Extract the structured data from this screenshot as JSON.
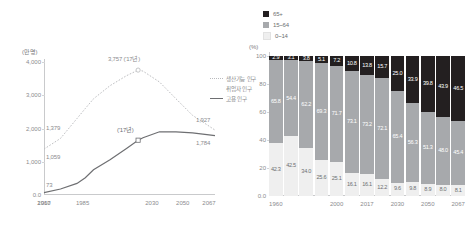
{
  "chart_data": [
    {
      "type": "line",
      "name": "population-projection-line-chart",
      "title": "",
      "ylabel": "(만명)",
      "xlabel": "",
      "ylim": [
        0,
        4000
      ],
      "yticks": [
        "0.0",
        "1,000",
        "2,000",
        "3,000",
        "4,000"
      ],
      "ytick_values": [
        0,
        1000,
        2000,
        3000,
        4000
      ],
      "xticks": [
        "1960",
        "1985",
        "2017",
        "2030",
        "2050",
        "2067"
      ],
      "grid": false,
      "legend_position": "right",
      "series": [
        {
          "name": "생산가능 인구",
          "style": "dotted",
          "color": "#b9babd",
          "x": [
            1960,
            1970,
            1980,
            1985,
            1990,
            2000,
            2010,
            2017,
            2020,
            2030,
            2040,
            2050,
            2060,
            2067
          ],
          "values": [
            1379,
            1700,
            2300,
            2600,
            2900,
            3300,
            3600,
            3757,
            3730,
            3400,
            2900,
            2400,
            2050,
            1927
          ]
        },
        {
          "name": "고용 인구",
          "style": "solid",
          "color": "#6e6f72",
          "x": [
            1960,
            1970,
            1980,
            1985,
            1990,
            2000,
            2010,
            2017,
            2020,
            2030,
            2040,
            2050,
            2060,
            2067
          ],
          "values": [
            73,
            180,
            350,
            520,
            760,
            1059,
            1400,
            1650,
            1720,
            1900,
            1900,
            1870,
            1810,
            1784
          ]
        }
      ],
      "annotations": [
        {
          "text": "3,757 ('17년)",
          "x": 2017,
          "y": 3757,
          "series": "생산가능 인구"
        },
        {
          "text": "('17년)",
          "x": 2017,
          "y": 1650,
          "series": "고용 인구"
        },
        {
          "text": "1,379",
          "x": 1960,
          "y": 1379,
          "series": "생산가능 인구"
        },
        {
          "text": "1,059",
          "x": 2000,
          "y": 1059,
          "series": "고용 인구"
        },
        {
          "text": "73",
          "x": 1960,
          "y": 73,
          "series": "고용 인구"
        },
        {
          "text": "1,927",
          "x": 2067,
          "y": 1927,
          "series": "생산가능 인구"
        },
        {
          "text": "1,784",
          "x": 2067,
          "y": 1784,
          "series": "고용 인구"
        }
      ],
      "legend": [
        {
          "label": "생산가능 인구",
          "style": "dotted",
          "color": "#b9babd"
        },
        {
          "label": "취업자 인구",
          "style": "none",
          "color": "#b9babd"
        },
        {
          "label": "고용 인구",
          "style": "solid",
          "color": "#6e6f72"
        }
      ]
    },
    {
      "type": "bar",
      "subtype": "stacked-percent",
      "name": "age-composition-stacked-bar-chart",
      "title": "",
      "ylabel": "(%)",
      "xlabel": "",
      "ylim": [
        0,
        100
      ],
      "yticks": [
        "0.0",
        "20",
        "40",
        "60",
        "80",
        "100"
      ],
      "ytick_values": [
        0,
        20,
        40,
        60,
        80,
        100
      ],
      "grid": false,
      "legend_position": "top-left",
      "categories": [
        "1960",
        "1970",
        "1980",
        "1990",
        "2000",
        "2010",
        "2017",
        "2020",
        "2030",
        "2040",
        "2050",
        "2060",
        "2067"
      ],
      "xticks": [
        "1960",
        "2000",
        "2017",
        "2030",
        "2050",
        "2067"
      ],
      "xtick_index": [
        0,
        4,
        6,
        8,
        10,
        12
      ],
      "legend": [
        {
          "label": "65+",
          "color": "#231f20"
        },
        {
          "label": "15~64",
          "color": "#a7a9ac"
        },
        {
          "label": "0~14",
          "color": "#efefef"
        }
      ],
      "series": [
        {
          "name": "0~14",
          "color": "#efefef",
          "values": [
            42.3,
            42.5,
            34.0,
            25.6,
            25.1,
            16.1,
            16.1,
            12.2,
            9.6,
            9.8,
            8.9,
            8.0,
            8.1
          ]
        },
        {
          "name": "15~64",
          "color": "#a7a9ac",
          "values": [
            65.8,
            54.4,
            62.2,
            69.3,
            71.7,
            73.1,
            73.2,
            72.1,
            65.4,
            56.3,
            51.3,
            48.0,
            45.4
          ]
        },
        {
          "name": "65+",
          "color": "#231f20",
          "values": [
            2.9,
            3.1,
            3.8,
            5.1,
            7.2,
            10.8,
            13.8,
            15.7,
            25.0,
            33.9,
            39.8,
            43.9,
            46.5
          ]
        }
      ]
    }
  ]
}
